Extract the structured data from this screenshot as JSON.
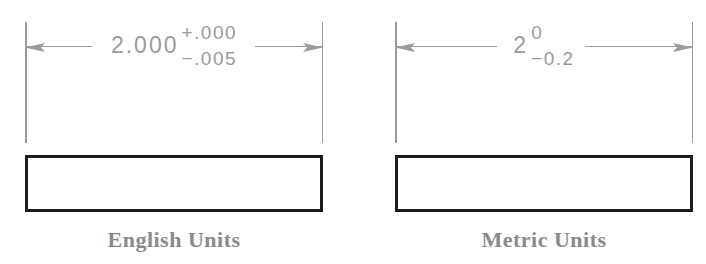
{
  "figures": [
    {
      "id": "english",
      "dimension": {
        "value": "2.000",
        "tolerance_upper": "+.000",
        "tolerance_lower": "−.005"
      },
      "caption": "English Units"
    },
    {
      "id": "metric",
      "dimension": {
        "value": "2",
        "tolerance_upper": "0",
        "tolerance_lower": "−0.2"
      },
      "caption": "Metric Units"
    }
  ],
  "colors": {
    "dimension": "#9b9b9b",
    "caption": "#8a8a8a",
    "part_outline": "#1b1b1b",
    "background": "#ffffff"
  }
}
